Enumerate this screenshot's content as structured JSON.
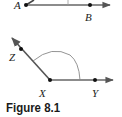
{
  "figure": {
    "caption": "Figure 8.1",
    "angle_top": {
      "vertex_label": "A",
      "point_labels": [
        "B"
      ]
    },
    "angle_bottom": {
      "vertex_label": "X",
      "point_labels": [
        "Z",
        "Y"
      ]
    }
  },
  "colors": {
    "line": "#555555",
    "point": "#111111",
    "arc": "#888888"
  }
}
